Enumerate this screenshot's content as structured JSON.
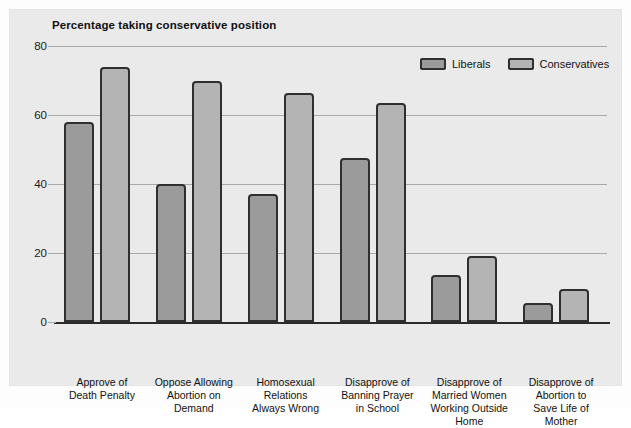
{
  "figure": {
    "panel_background": "#eaeaea",
    "page_background": "#ffffff"
  },
  "legend": {
    "position": "top-right",
    "entries": [
      {
        "label": "Liberals",
        "color": "#9b9b9b"
      },
      {
        "label": "Conservatives",
        "color": "#b4b4b4"
      }
    ]
  },
  "chart_data": {
    "type": "bar",
    "title": "Percentage taking conservative position",
    "xlabel": "",
    "ylabel": "",
    "ylim": [
      0,
      80
    ],
    "yticks": [
      0,
      20,
      40,
      60,
      80
    ],
    "ytick_labels": [
      "0",
      "20",
      "40",
      "60",
      "80"
    ],
    "grid": true,
    "grid_axis": "y",
    "legend_position": "top-right",
    "categories": [
      "Approve of Death Penalty",
      "Oppose Allowing Abortion on Demand",
      "Homosexual Relations Always Wrong",
      "Disapprove of Banning Prayer in School",
      "Disapprove of Married Women Working Outside Home",
      "Disapprove of Abortion to Save Life of Mother"
    ],
    "category_label_lines": [
      [
        "Approve of",
        "Death Penalty"
      ],
      [
        "Oppose Allowing",
        "Abortion on",
        "Demand"
      ],
      [
        "Homosexual",
        "Relations",
        "Always Wrong"
      ],
      [
        "Disapprove of",
        "Banning Prayer",
        "in School"
      ],
      [
        "Disapprove of",
        "Married Women",
        "Working Outside",
        "Home"
      ],
      [
        "Disapprove of",
        "Abortion to",
        "Save Life of",
        "Mother"
      ]
    ],
    "series": [
      {
        "name": "Liberals",
        "color": "#9b9b9b",
        "values": [
          58,
          40,
          37,
          47.5,
          13.5,
          5.5
        ]
      },
      {
        "name": "Conservatives",
        "color": "#b4b4b4",
        "values": [
          74,
          70,
          66.5,
          63.5,
          19,
          9.5
        ]
      }
    ]
  }
}
